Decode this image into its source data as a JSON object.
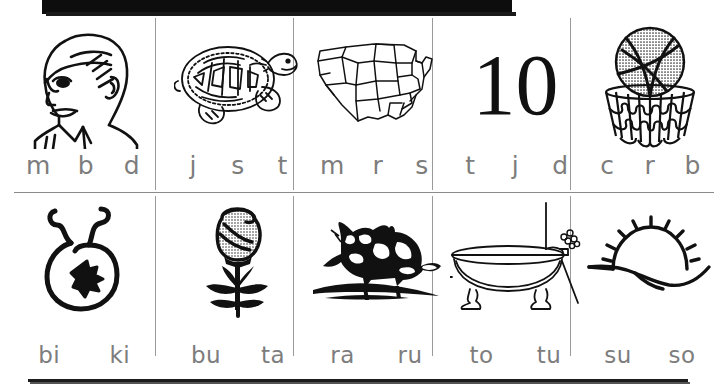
{
  "worksheet": {
    "title": "beginning sound picture worksheet",
    "letter_color": "#7d7d7d",
    "ink_color": "#111111",
    "grid_line_color": "#9a9a9a",
    "header_bar_color": "#0d0d0d",
    "rows": [
      {
        "row_label": "row-1",
        "cells": [
          {
            "picture": "boy-face-icon",
            "picture_label": "boy",
            "choices": [
              "m",
              "b",
              "d"
            ]
          },
          {
            "picture": "turtle-icon",
            "picture_label": "turtle",
            "choices": [
              "j",
              "s",
              "t"
            ]
          },
          {
            "picture": "usa-map-icon",
            "picture_label": "map",
            "choices": [
              "m",
              "r",
              "s"
            ]
          },
          {
            "picture": "number-ten-icon",
            "picture_label": "10",
            "number_text": "10",
            "choices": [
              "t",
              "j",
              "d"
            ]
          },
          {
            "picture": "basketball-hoop-icon",
            "picture_label": "basketball",
            "choices": [
              "c",
              "r",
              "b"
            ]
          }
        ]
      },
      {
        "row_label": "row-2",
        "cells": [
          {
            "picture": "bib-icon",
            "picture_label": "bib",
            "choices": [
              "bi",
              "ki"
            ]
          },
          {
            "picture": "rose-icon",
            "picture_label": "rose",
            "choices": [
              "bu",
              "ta"
            ]
          },
          {
            "picture": "raccoon-icon",
            "picture_label": "raccoon",
            "choices": [
              "ra",
              "ru"
            ]
          },
          {
            "picture": "bathtub-icon",
            "picture_label": "bathtub",
            "choices": [
              "to",
              "tu"
            ]
          },
          {
            "picture": "sunrise-icon",
            "picture_label": "sun",
            "choices": [
              "su",
              "so"
            ]
          }
        ]
      }
    ]
  }
}
